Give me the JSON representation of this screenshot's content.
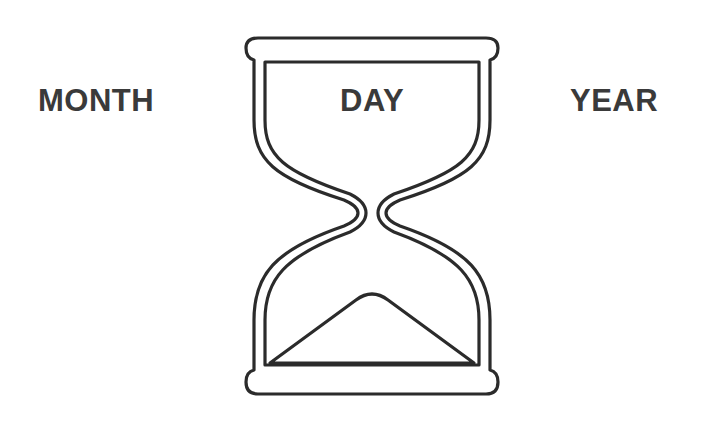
{
  "labels": {
    "left": "MONTH",
    "center": "DAY",
    "right": "YEAR"
  },
  "icon": {
    "name": "hourglass-icon",
    "stroke_color": "#2b2b2b",
    "fill_color": "#ffffff"
  },
  "colors": {
    "text": "#3a3a3a",
    "background": "#ffffff"
  }
}
